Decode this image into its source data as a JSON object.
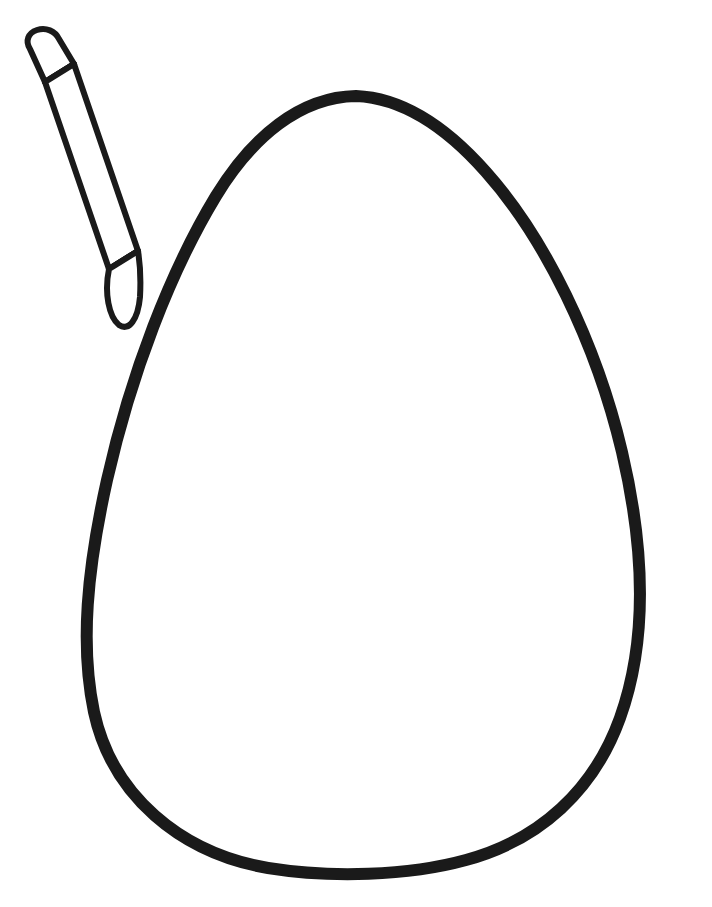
{
  "page": {
    "kind": "line-art-coloring-template",
    "width": 712,
    "height": 907,
    "background_color": "#ffffff",
    "text_content": "",
    "has_visible_text": false
  },
  "palette": {
    "ink": "#1a1a1a",
    "paper": "#ffffff"
  },
  "artwork": {
    "description": "Black outline drawing of a large blank egg shape with a small crayon at the upper left",
    "objects": [
      {
        "name": "egg-outline",
        "label": "Egg",
        "stroke_color": "#1a1a1a",
        "stroke_width": 12,
        "fill": "none",
        "bounds": {
          "x": 82,
          "y": 92,
          "width": 558,
          "height": 784
        },
        "apex_point": {
          "x": 356,
          "y": 96
        },
        "leftmost_point": {
          "x": 84,
          "y": 648
        },
        "rightmost_point": {
          "x": 638,
          "y": 598
        },
        "bottom_point": {
          "x": 362,
          "y": 870
        },
        "path": "M 356 96 C 300 97 252 137 216 196 C 170 272 131 374 107 480 C 87 570 80 645 94 712 C 112 795 180 853 268 868 C 330 878 408 876 466 860 C 540 840 594 790 620 718 C 648 640 644 546 622 452 C 596 342 544 237 486 172 C 448 129 404 98 356 96 Z"
      },
      {
        "name": "crayon",
        "label": "Crayon",
        "stroke_color": "#1a1a1a",
        "stroke_width": 6,
        "fill": "none",
        "rotation_degrees": 27,
        "bounds": {
          "x": 20,
          "y": 30,
          "width": 125,
          "height": 298
        },
        "parts": [
          {
            "name": "crayon-cap",
            "label": "Cap"
          },
          {
            "name": "crayon-cap-band",
            "label": "Cap band"
          },
          {
            "name": "crayon-body",
            "label": "Body"
          },
          {
            "name": "crayon-tip-band",
            "label": "Tip band"
          },
          {
            "name": "crayon-tip",
            "label": "Point"
          }
        ]
      }
    ]
  },
  "geometry": {
    "crayon": {
      "cap_path": "M 30 49 C 26 42 29 35 37 32 C 45 29 53 32 57 39 L 72 63 L 44 81 Z",
      "band_line": "M 44 81 L 72 63",
      "body_path": "M 44 81 L 108 268 L 136 250 L 72 63 Z",
      "tip_band_line": "M 108 268 L 136 250",
      "tip_path": "M 108 268 C 104 292 108 316 118 324 C 128 331 137 318 139 296 C 140 277 139 262 136 250 Z"
    }
  }
}
